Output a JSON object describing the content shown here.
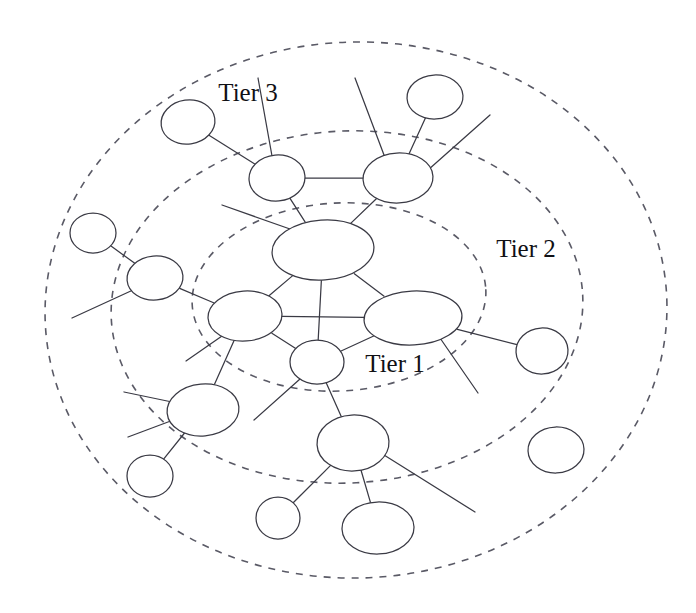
{
  "diagram": {
    "canvas": {
      "width": 696,
      "height": 613
    },
    "background_color": "#ffffff",
    "node_stroke_color": "#3a3a44",
    "node_fill_color": "#ffffff",
    "boundary_stroke_color": "#5a5a66",
    "label_color": "#101014"
  },
  "tier_labels": [
    {
      "id": "tier3",
      "text": "Tier 3",
      "x": 248,
      "y": 95,
      "anchor": "middle"
    },
    {
      "id": "tier2",
      "text": "Tier 2",
      "x": 526,
      "y": 251,
      "anchor": "middle"
    },
    {
      "id": "tier1",
      "text": "Tier 1",
      "x": 395,
      "y": 366,
      "anchor": "middle"
    }
  ],
  "tier_boundaries": [
    {
      "id": "tier3-boundary",
      "label": "Tier 3",
      "cx": 356,
      "cy": 310,
      "rx": 311,
      "ry": 268,
      "rotate": -2
    },
    {
      "id": "tier2-boundary",
      "label": "Tier 2",
      "cx": 347,
      "cy": 307,
      "rx": 236,
      "ry": 176,
      "rotate": -3
    },
    {
      "id": "tier1-boundary",
      "label": "Tier 1",
      "cx": 339,
      "cy": 297,
      "rx": 147,
      "ry": 94,
      "rotate": -3
    }
  ],
  "nodes": [
    {
      "id": "n-core-top",
      "tier": 1,
      "cx": 323,
      "cy": 250,
      "rx": 51,
      "ry": 30,
      "rotate": -4
    },
    {
      "id": "n-core-left",
      "tier": 1,
      "cx": 245,
      "cy": 316,
      "rx": 37,
      "ry": 25,
      "rotate": -4
    },
    {
      "id": "n-core-right",
      "tier": 1,
      "cx": 413,
      "cy": 318,
      "rx": 49,
      "ry": 27,
      "rotate": -3
    },
    {
      "id": "n-core-bottom",
      "tier": 1,
      "cx": 317,
      "cy": 362,
      "rx": 27,
      "ry": 22,
      "rotate": 0
    },
    {
      "id": "n-t2-upper-left",
      "tier": 2,
      "cx": 277,
      "cy": 178,
      "rx": 28,
      "ry": 23,
      "rotate": -5
    },
    {
      "id": "n-t2-upper-right",
      "tier": 2,
      "cx": 398,
      "cy": 178,
      "rx": 35,
      "ry": 25,
      "rotate": -3
    },
    {
      "id": "n-t2-left",
      "tier": 2,
      "cx": 155,
      "cy": 278,
      "rx": 28,
      "ry": 22,
      "rotate": -5
    },
    {
      "id": "n-t2-lower-left",
      "tier": 2,
      "cx": 203,
      "cy": 410,
      "rx": 36,
      "ry": 26,
      "rotate": -5
    },
    {
      "id": "n-t2-lower-mid",
      "tier": 2,
      "cx": 353,
      "cy": 443,
      "rx": 36,
      "ry": 28,
      "rotate": -3
    },
    {
      "id": "n-t3-top-left",
      "tier": 3,
      "cx": 188,
      "cy": 122,
      "rx": 27,
      "ry": 22,
      "rotate": -8
    },
    {
      "id": "n-t3-top-right",
      "tier": 3,
      "cx": 435,
      "cy": 97,
      "rx": 28,
      "ry": 22,
      "rotate": -3
    },
    {
      "id": "n-t3-left",
      "tier": 3,
      "cx": 93,
      "cy": 233,
      "rx": 23,
      "ry": 20,
      "rotate": 0
    },
    {
      "id": "n-t3-right",
      "tier": 3,
      "cx": 542,
      "cy": 351,
      "rx": 26,
      "ry": 23,
      "rotate": -3
    },
    {
      "id": "n-t3-bottom-left",
      "tier": 3,
      "cx": 150,
      "cy": 476,
      "rx": 23,
      "ry": 21,
      "rotate": 0
    },
    {
      "id": "n-t3-bottom-small",
      "tier": 3,
      "cx": 278,
      "cy": 518,
      "rx": 22,
      "ry": 21,
      "rotate": 0
    },
    {
      "id": "n-t3-bottom-wide",
      "tier": 3,
      "cx": 378,
      "cy": 528,
      "rx": 36,
      "ry": 26,
      "rotate": -2
    },
    {
      "id": "n-t3-isolated",
      "tier": 3,
      "cx": 556,
      "cy": 450,
      "rx": 28,
      "ry": 23,
      "rotate": -2
    }
  ],
  "edges": [
    {
      "id": "e-coretop-coreleft",
      "from": "n-core-top",
      "to": "n-core-left"
    },
    {
      "id": "e-coretop-coreright",
      "from": "n-core-top",
      "to": "n-core-right"
    },
    {
      "id": "e-coretop-corebottom",
      "from": "n-core-top",
      "to": "n-core-bottom"
    },
    {
      "id": "e-coreleft-coreright",
      "from": "n-core-left",
      "to": "n-core-right"
    },
    {
      "id": "e-coreleft-corebottom",
      "from": "n-core-left",
      "to": "n-core-bottom"
    },
    {
      "id": "e-coreright-corebottom",
      "from": "n-core-right",
      "to": "n-core-bottom"
    },
    {
      "id": "e-coretop-t2ul",
      "from": "n-core-top",
      "to": "n-t2-upper-left"
    },
    {
      "id": "e-coretop-t2ur",
      "from": "n-core-top",
      "to": "n-t2-upper-right"
    },
    {
      "id": "e-t2ul-t2ur",
      "from": "n-t2-upper-left",
      "to": "n-t2-upper-right"
    },
    {
      "id": "e-t2ul-t3tl",
      "from": "n-t2-upper-left",
      "to": "n-t3-top-left"
    },
    {
      "id": "e-t2ur-t3tr",
      "from": "n-t2-upper-right",
      "to": "n-t3-top-right"
    },
    {
      "id": "e-t2left-t3left",
      "from": "n-t2-left",
      "to": "n-t3-left"
    },
    {
      "id": "e-t2left-coreleft",
      "from": "n-t2-left",
      "to": "n-core-left"
    },
    {
      "id": "e-coreleft-t2ll",
      "from": "n-core-left",
      "to": "n-t2-lower-left"
    },
    {
      "id": "e-t2ll-t3bl",
      "from": "n-t2-lower-left",
      "to": "n-t3-bottom-left"
    },
    {
      "id": "e-corebottom-t2lm",
      "from": "n-core-bottom",
      "to": "n-t2-lower-mid"
    },
    {
      "id": "e-t2lm-t3bs",
      "from": "n-t2-lower-mid",
      "to": "n-t3-bottom-small"
    },
    {
      "id": "e-t2lm-t3bw",
      "from": "n-t2-lower-mid",
      "to": "n-t3-bottom-wide"
    },
    {
      "id": "e-coreright-t3right",
      "from": "n-core-right",
      "to": "n-t3-right"
    }
  ],
  "stubs": [
    {
      "id": "s-coretop-upleft",
      "x1": 290,
      "y1": 229,
      "x2": 222,
      "y2": 205
    },
    {
      "id": "s-t2ul-up",
      "x1": 272,
      "y1": 156,
      "x2": 258,
      "y2": 78
    },
    {
      "id": "s-t2ur-up",
      "x1": 384,
      "y1": 155,
      "x2": 355,
      "y2": 78
    },
    {
      "id": "s-t2ur-upright",
      "x1": 428,
      "y1": 170,
      "x2": 490,
      "y2": 115
    },
    {
      "id": "s-t2left-downleft",
      "x1": 133,
      "y1": 290,
      "x2": 72,
      "y2": 318
    },
    {
      "id": "s-coreleft-downleft",
      "x1": 222,
      "y1": 336,
      "x2": 186,
      "y2": 361
    },
    {
      "id": "s-t2ll-left",
      "x1": 172,
      "y1": 402,
      "x2": 124,
      "y2": 392
    },
    {
      "id": "s-t2ll-leftlow",
      "x1": 176,
      "y1": 419,
      "x2": 128,
      "y2": 437
    },
    {
      "id": "s-corebottom-downleft",
      "x1": 300,
      "y1": 379,
      "x2": 254,
      "y2": 420
    },
    {
      "id": "s-coreright-downright",
      "x1": 440,
      "y1": 338,
      "x2": 478,
      "y2": 393
    },
    {
      "id": "s-t2lm-downright",
      "x1": 384,
      "y1": 455,
      "x2": 475,
      "y2": 512
    }
  ]
}
